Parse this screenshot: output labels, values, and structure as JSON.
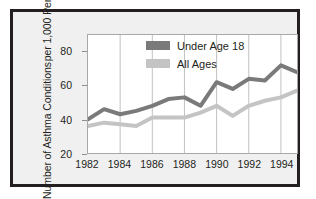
{
  "chart_data": {
    "type": "line",
    "title": "",
    "xlabel": "",
    "ylabel_line1": "Number of Asthma Conditions",
    "ylabel_line2": "per 1,000 Persons",
    "xlim": [
      1982,
      1995
    ],
    "ylim": [
      20,
      90
    ],
    "yticks": [
      20,
      40,
      60,
      80
    ],
    "xticks": [
      1982,
      1984,
      1986,
      1988,
      1990,
      1992,
      1994
    ],
    "grid": "vertical",
    "legend_position": "top-right",
    "x": [
      1982,
      1983,
      1984,
      1985,
      1986,
      1987,
      1988,
      1989,
      1990,
      1991,
      1992,
      1993,
      1994,
      1995
    ],
    "series": [
      {
        "name": "Under Age 18",
        "color": "#7a7a7a",
        "values": [
          40,
          46,
          43,
          45,
          48,
          52,
          53,
          48,
          62,
          58,
          64,
          63,
          72,
          68
        ]
      },
      {
        "name": "All Ages",
        "color": "#c4c4c4",
        "values": [
          36,
          38,
          37,
          36,
          41,
          41,
          41,
          44,
          48,
          42,
          48,
          51,
          53,
          57
        ]
      }
    ]
  },
  "legend": {
    "items": [
      {
        "label": "Under Age 18",
        "color": "#7a7a7a"
      },
      {
        "label": "All Ages",
        "color": "#c4c4c4"
      }
    ]
  },
  "colors": {
    "border": "#231f20",
    "figure_background": "#f0f0f0",
    "plot_background": "#ffffff",
    "gridline": "#b0b0b0",
    "axis": "#8d8d8d",
    "series_under18": "#7a7a7a",
    "series_allages": "#c4c4c4",
    "text": "#231f20"
  }
}
